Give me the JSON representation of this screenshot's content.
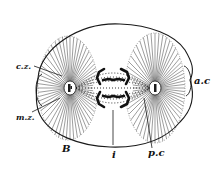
{
  "figure": {
    "labels": {
      "cz": "c.z.",
      "mz": "m.z.",
      "B": "B",
      "i": "i",
      "pc": "p.c",
      "ac": "a.c"
    },
    "colors": {
      "ink": "#1a1a1a",
      "background": "#ffffff"
    }
  }
}
